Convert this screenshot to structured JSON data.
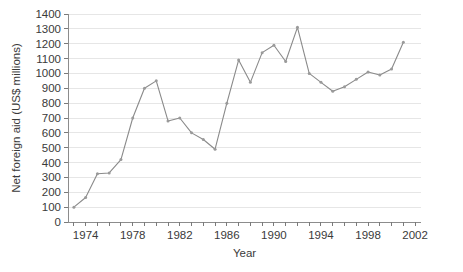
{
  "chart_data": {
    "type": "line",
    "title": "",
    "xlabel": "Year",
    "ylabel": "Net foreign aid (US$ millions)",
    "xlim": [
      1972.5,
      2002.5
    ],
    "ylim": [
      0,
      1400
    ],
    "grid": true,
    "legend": false,
    "y_ticks": [
      0,
      100,
      200,
      300,
      400,
      500,
      600,
      700,
      800,
      900,
      1000,
      1100,
      1200,
      1300,
      1400
    ],
    "y_tick_labels": [
      "0",
      "100",
      "200",
      "300",
      "400",
      "500",
      "600",
      "700",
      "800",
      "900",
      "1000",
      "1100",
      "1200",
      "1300",
      "1400"
    ],
    "x_ticks": [
      1974,
      1978,
      1982,
      1986,
      1990,
      1994,
      1998,
      2002
    ],
    "x_tick_labels": [
      "1974",
      "1978",
      "1982",
      "1986",
      "1990",
      "1994",
      "1998",
      "2002"
    ],
    "x_minor_step": 1,
    "series": [
      {
        "name": "Net foreign aid",
        "color": "#8a8a8a",
        "x": [
          1973,
          1974,
          1975,
          1976,
          1977,
          1978,
          1979,
          1980,
          1981,
          1982,
          1983,
          1984,
          1985,
          1986,
          1987,
          1988,
          1989,
          1990,
          1991,
          1992,
          1993,
          1994,
          1995,
          1996,
          1997,
          1998,
          1999,
          2000,
          2001
        ],
        "values": [
          100,
          165,
          325,
          330,
          420,
          700,
          900,
          950,
          680,
          700,
          600,
          555,
          490,
          800,
          1090,
          940,
          1140,
          1190,
          1080,
          1310,
          1000,
          940,
          880,
          910,
          960,
          1010,
          990,
          1030,
          1210
        ]
      }
    ]
  },
  "colors": {
    "background": "#ffffff",
    "line": "#8a8a8a",
    "marker": "#9a9a9a",
    "grid": "#e6e6e6",
    "axis": "#8c8c8c",
    "text": "#3a3a3a"
  }
}
